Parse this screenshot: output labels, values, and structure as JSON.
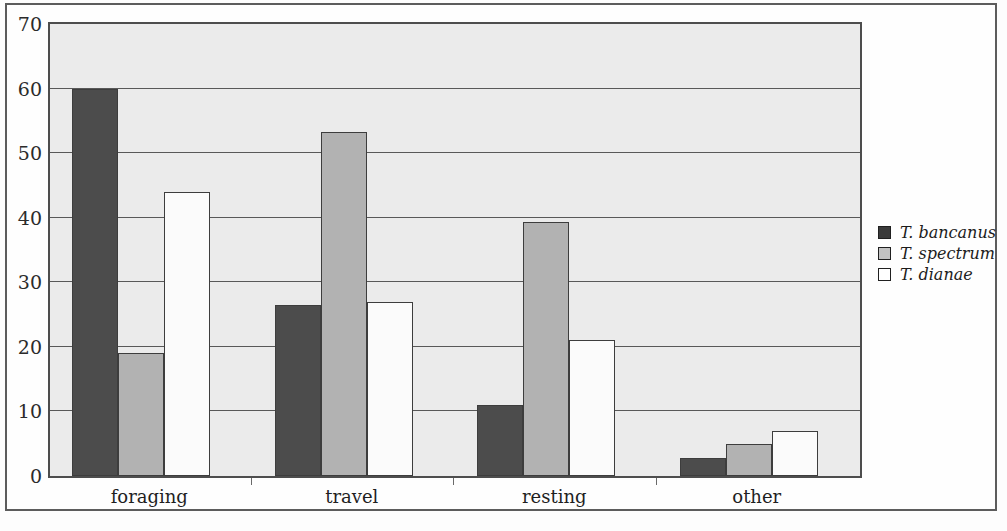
{
  "chart_data": {
    "type": "bar",
    "title": "",
    "subtitle": "",
    "xlabel": "",
    "ylabel": "",
    "categories": [
      "foraging",
      "travel",
      "resting",
      "other"
    ],
    "series": [
      {
        "name": "T. bancanus",
        "color": "#4c4c4c",
        "values": [
          60,
          26.5,
          11,
          2.8
        ]
      },
      {
        "name": "T. spectrum",
        "color": "#b2b2b2",
        "values": [
          19,
          53.2,
          39.3,
          5
        ]
      },
      {
        "name": "T. dianae",
        "color": "#fbfbfb",
        "values": [
          44,
          27,
          21,
          7
        ]
      }
    ],
    "ylim": [
      0,
      70
    ],
    "yticks": [
      0,
      10,
      20,
      30,
      40,
      50,
      60,
      70
    ],
    "ytick_labels": [
      "0",
      "10",
      "20",
      "30",
      "40",
      "50",
      "60",
      "70"
    ],
    "grid": true,
    "grid_axis": "y",
    "legend_position": "right",
    "plot_background": "#ebebeb",
    "frame_color": "#4d4d4d"
  },
  "legend": {
    "entries": [
      {
        "label": "T. bancanus",
        "swatch": "dark-gray-swatch"
      },
      {
        "label": "T. spectrum",
        "swatch": "medium-gray-swatch"
      },
      {
        "label": "T. dianae",
        "swatch": "white-swatch"
      }
    ]
  }
}
